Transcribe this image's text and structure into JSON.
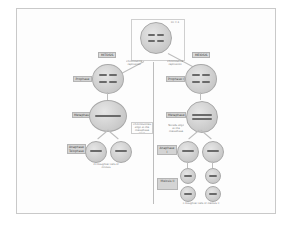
{
  "diagram": {
    "parent": {
      "label": "Parent cell",
      "note": "2n = 4"
    },
    "replication_note": "Chromosome replication",
    "mitosis": {
      "heading": "MITOSIS",
      "stages": [
        "Prophase",
        "Metaphase",
        "Anaphase Telophase"
      ],
      "metaphase_note": "Chromosomes align at the metaphase plate",
      "result_note": "2n Daughter cells of mitosis"
    },
    "meiosis": {
      "heading": "MEIOSIS",
      "stages": [
        "Prophase I",
        "Metaphase I",
        "Anaphase I Telophase I",
        "Meiosis II"
      ],
      "metaphase_note": "Tetrads align at the metaphase plate",
      "result_note": "n Daughter cells of meiosis II"
    }
  }
}
